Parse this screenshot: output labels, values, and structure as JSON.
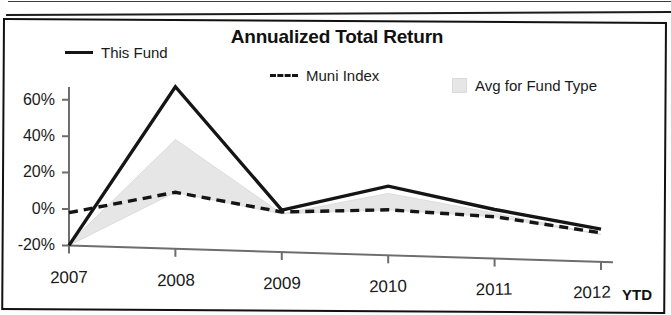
{
  "chart_data": {
    "type": "line",
    "title": "Annualized Total Return",
    "xlabel": "",
    "ylabel": "",
    "categories": [
      "2007",
      "2008",
      "2009",
      "2010",
      "2011",
      "2012"
    ],
    "x_axis_suffix_label": "YTD",
    "ylim": [
      -20,
      60
    ],
    "yticks": [
      -20,
      0,
      20,
      40,
      60
    ],
    "ytick_labels": [
      "-20%",
      "0%",
      "20%",
      "40%",
      "60%"
    ],
    "grid": false,
    "legend_position": "top",
    "series": [
      {
        "name": "This Fund",
        "style": "solid",
        "color": "#151515",
        "values": [
          -20,
          69,
          3,
          18,
          7,
          -2
        ]
      },
      {
        "name": "Muni Index",
        "style": "dashed",
        "color": "#151515",
        "values": [
          -2,
          11,
          2,
          5,
          3,
          -4
        ]
      },
      {
        "name": "Avg for Fund Type",
        "style": "area",
        "color": "#e6e6e6",
        "values": [
          -19,
          40,
          1,
          14,
          5,
          -5
        ]
      }
    ]
  },
  "legend": {
    "this_fund": "This Fund",
    "muni_index": "Muni Index",
    "avg_for_fund_type": "Avg for Fund Type"
  },
  "axis": {
    "y_60": "60%",
    "y_40": "40%",
    "y_20": "20%",
    "y_0": "0%",
    "y_neg20": "-20%",
    "x_2007": "2007",
    "x_2008": "2008",
    "x_2009": "2009",
    "x_2010": "2010",
    "x_2011": "2011",
    "x_2012": "2012",
    "ytd": "YTD"
  }
}
